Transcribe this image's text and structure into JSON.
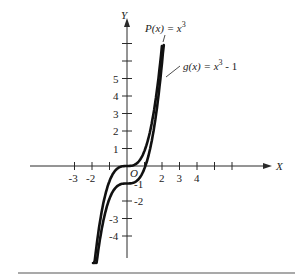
{
  "chart_data": {
    "type": "line",
    "title": "",
    "xlabel": "X",
    "ylabel": "Y",
    "origin_label": "O",
    "x_tick_labels": [
      "-3",
      "-2",
      "2",
      "3",
      "4"
    ],
    "x_ticks": [
      -3,
      -2,
      -1,
      1,
      2,
      3,
      4,
      5,
      6
    ],
    "y_tick_labels": [
      "-4",
      "-3",
      "-2",
      "-1",
      "1",
      "2",
      "3",
      "4",
      "5"
    ],
    "y_ticks": [
      -4,
      -3,
      -2,
      -1,
      1,
      2,
      3,
      4,
      5,
      6,
      7
    ],
    "xlim": [
      -6,
      8
    ],
    "ylim": [
      -5.5,
      7
    ],
    "grid": false,
    "series": [
      {
        "name": "P(x) = x^3",
        "label": "P(x) = x",
        "exponent": "3",
        "suffix": "",
        "function": "x^3",
        "x_range": [
          -1.85,
          1.9
        ]
      },
      {
        "name": "g(x) = x^3 - 1",
        "label": "g(x) = x",
        "exponent": "3",
        "suffix": " - 1",
        "function": "x^3 - 1",
        "x_range": [
          -1.7,
          2.0
        ]
      }
    ]
  }
}
